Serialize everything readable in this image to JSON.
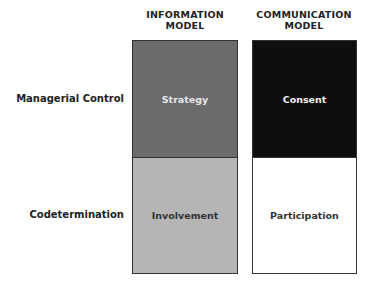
{
  "columns": [
    {
      "header_line1": "INFORMATION",
      "header_line2": "MODEL"
    },
    {
      "header_line1": "COMMUNICATION",
      "header_line2": "MODEL"
    }
  ],
  "rows": [
    {
      "label": "Managerial Control"
    },
    {
      "label": "Codetermination"
    }
  ],
  "cells": {
    "info_control": {
      "label": "Strategy",
      "fill": "#6b6b6b",
      "text_color": "#e6e6e6"
    },
    "comm_control": {
      "label": "Consent",
      "fill": "#0e0e0e",
      "text_color": "#f2f2f2"
    },
    "info_codet": {
      "label": "Involvement",
      "fill": "#b5b5b5",
      "text_color": "#333333"
    },
    "comm_codet": {
      "label": "Participation",
      "fill": "#ffffff",
      "text_color": "#333333"
    }
  }
}
